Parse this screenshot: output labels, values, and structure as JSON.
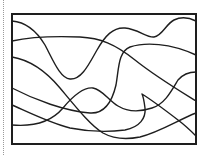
{
  "canvas": {
    "width": 209,
    "height": 155,
    "background": "#ffffff"
  },
  "guide": {
    "style": "dotted",
    "x": 3,
    "color": "#9a9a9a"
  },
  "frame": {
    "x": 12,
    "y": 14,
    "width": 184,
    "height": 130,
    "stroke": "#1e1e1e",
    "stroke_width": 2
  },
  "curves": [
    {
      "id": "curve-1",
      "d": "M12,21 C25,22 36,30 45,45 C53,60 60,78 70,79 C82,80 90,62 97,50 C105,36 113,27 125,28 C138,29 147,38 154,37 C162,36 166,24 174,20 C182,16 190,18 196,21"
    },
    {
      "id": "curve-2",
      "d": "M12,41 C30,37 55,36 80,37 C100,38 115,44 135,60 C155,76 175,88 196,101"
    },
    {
      "id": "curve-3",
      "d": "M12,57 C30,60 45,70 60,88 C75,106 90,125 103,133 C112,138 125,140 140,137 C160,132 178,120 196,113"
    },
    {
      "id": "curve-4",
      "d": "M12,88 C35,100 65,111 90,113 C105,114 112,102 116,85 C119,68 118,52 130,47 C145,42 170,43 196,55"
    },
    {
      "id": "curve-5",
      "d": "M12,125 C35,127 52,121 63,108 C73,96 84,87 93,88 C103,90 108,100 118,106 C128,112 140,112 152,108 C165,104 172,90 178,80 C184,73 190,72 196,72"
    },
    {
      "id": "curve-6",
      "d": "M12,105 C30,113 50,123 70,128 C90,132 110,132 125,130 C140,127 146,118 145,108 C144,100 143,96 142,94 C150,99 165,110 178,120 C186,126 192,132 196,136"
    }
  ],
  "curve_stroke": "#1e1e1e"
}
